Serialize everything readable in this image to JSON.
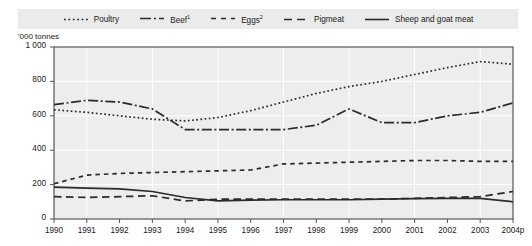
{
  "unit_label": "'000 tonnes",
  "legend": {
    "items": [
      {
        "label": "Poultry",
        "style": "dotted",
        "sup": ""
      },
      {
        "label": "Beef",
        "style": "dashdot",
        "sup": "1"
      },
      {
        "label": "Eggs",
        "style": "shortdash",
        "sup": "2"
      },
      {
        "label": "Pigmeat",
        "style": "longdash",
        "sup": ""
      },
      {
        "label": "Sheep and goat meat",
        "style": "solid",
        "sup": ""
      }
    ]
  },
  "colors": {
    "line": "#2b2b2b",
    "plot_background": "#ededed",
    "gridline": "#ffffff",
    "legend_background": "#ebebeb",
    "axis": "#555555",
    "page_background": "#ffffff"
  },
  "chart_data": {
    "type": "line",
    "title": "",
    "subtitle": "",
    "xlabel": "",
    "ylabel": "'000 tonnes",
    "ylim": [
      0,
      1000
    ],
    "yticks": [
      0,
      200,
      400,
      600,
      800,
      1000
    ],
    "ytick_labels": [
      "0",
      "200",
      "400",
      "600",
      "800",
      "1 000"
    ],
    "grid": true,
    "legend_position": "top",
    "x": [
      1990,
      1991,
      1992,
      1993,
      1994,
      1995,
      1996,
      1997,
      1998,
      1999,
      2000,
      2001,
      2002,
      2003,
      2004
    ],
    "categories": [
      "1990",
      "1991",
      "1992",
      "1993",
      "1994",
      "1995",
      "1996",
      "1997",
      "1998",
      "1999",
      "2000",
      "2001",
      "2002",
      "2003",
      "2004p"
    ],
    "series": [
      {
        "name": "Poultry",
        "style": "dotted",
        "values": [
          635,
          620,
          600,
          580,
          570,
          590,
          630,
          680,
          730,
          770,
          800,
          840,
          880,
          915,
          900
        ]
      },
      {
        "name": "Beef",
        "style": "dashdot",
        "values": [
          665,
          690,
          680,
          640,
          520,
          520,
          520,
          520,
          545,
          640,
          560,
          560,
          600,
          620,
          675
        ]
      },
      {
        "name": "Eggs",
        "style": "shortdash",
        "values": [
          205,
          255,
          265,
          270,
          275,
          280,
          285,
          320,
          325,
          330,
          335,
          340,
          340,
          335,
          335
        ]
      },
      {
        "name": "Pigmeat",
        "style": "longdash",
        "values": [
          130,
          125,
          130,
          135,
          105,
          115,
          115,
          115,
          115,
          115,
          115,
          120,
          125,
          130,
          160
        ]
      },
      {
        "name": "Sheep and goat meat",
        "style": "solid",
        "values": [
          185,
          180,
          175,
          160,
          125,
          105,
          110,
          112,
          112,
          112,
          115,
          118,
          120,
          120,
          100
        ]
      }
    ]
  }
}
